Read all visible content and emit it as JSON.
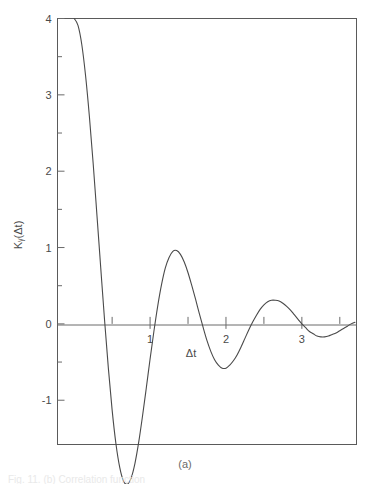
{
  "figure": {
    "panel_label": "(a)",
    "caption_partial": "Fig. 11. (b) Correlation function",
    "frame_color": "#5a5a5a",
    "curve_color": "#4a4a4a",
    "axis_color": "#6a6a6a"
  },
  "chart_data": {
    "type": "line",
    "title": "",
    "subtitle": "",
    "xlabel": "Δt",
    "ylabel": "Kᵧ(Δt)",
    "xlim": [
      -0.22,
      3.72
    ],
    "ylim": [
      -1.58,
      4.0
    ],
    "grid": false,
    "legend": null,
    "x_ticks_major": [
      1,
      2,
      3
    ],
    "x_ticks_major_labels": [
      "1",
      "2",
      "3"
    ],
    "x_ticks_minor": [
      0.5,
      1.5,
      2.5,
      3.5
    ],
    "y_ticks_major": [
      -1,
      0,
      1,
      2,
      3,
      4
    ],
    "y_ticks_major_labels": [
      "-1",
      "0",
      "1",
      "2",
      "3",
      "4"
    ],
    "y_ticks_minor": [
      -0.5,
      0.5,
      1.5,
      2.5,
      3.5
    ],
    "series": [
      {
        "name": "K_y(Δt)",
        "description": "damped oscillation 4*exp(-0.78*dt)*cos(3.45*dt)",
        "x": [
          0.0,
          0.05,
          0.1,
          0.15,
          0.2,
          0.25,
          0.3,
          0.35,
          0.4,
          0.45,
          0.5,
          0.55,
          0.6,
          0.65,
          0.7,
          0.75,
          0.8,
          0.85,
          0.9,
          0.95,
          1.0,
          1.05,
          1.1,
          1.15,
          1.2,
          1.25,
          1.3,
          1.35,
          1.4,
          1.45,
          1.5,
          1.55,
          1.6,
          1.65,
          1.7,
          1.75,
          1.8,
          1.85,
          1.9,
          1.95,
          2.0,
          2.05,
          2.1,
          2.15,
          2.2,
          2.25,
          2.3,
          2.35,
          2.4,
          2.45,
          2.5,
          2.55,
          2.6,
          2.65,
          2.7,
          2.75,
          2.8,
          2.85,
          2.9,
          2.95,
          3.0,
          3.05,
          3.1,
          3.15,
          3.2,
          3.25,
          3.3,
          3.35,
          3.4,
          3.45,
          3.5,
          3.55,
          3.6,
          3.65,
          3.7
        ],
        "y": [
          4.0,
          3.91,
          3.66,
          3.25,
          2.72,
          2.1,
          1.42,
          0.73,
          0.05,
          -0.58,
          -1.13,
          -1.57,
          -1.88,
          -2.06,
          -2.1,
          -2.02,
          -1.83,
          -1.55,
          -1.21,
          -0.84,
          -0.46,
          -0.1,
          0.23,
          0.51,
          0.73,
          0.87,
          0.95,
          0.96,
          0.91,
          0.81,
          0.67,
          0.5,
          0.32,
          0.13,
          -0.05,
          -0.22,
          -0.36,
          -0.47,
          -0.54,
          -0.58,
          -0.58,
          -0.54,
          -0.48,
          -0.4,
          -0.3,
          -0.19,
          -0.08,
          0.02,
          0.11,
          0.19,
          0.25,
          0.29,
          0.31,
          0.31,
          0.3,
          0.27,
          0.23,
          0.18,
          0.12,
          0.06,
          0.0,
          -0.05,
          -0.1,
          -0.13,
          -0.16,
          -0.17,
          -0.17,
          -0.16,
          -0.14,
          -0.12,
          -0.09,
          -0.06,
          -0.03,
          0.0,
          0.02
        ],
        "key_points": {
          "start": {
            "x": 0.0,
            "y": 4.0
          },
          "first_zero": {
            "x": 0.45,
            "y": 0.0
          },
          "global_min": {
            "x": 0.95,
            "y": -1.4
          },
          "second_zero": {
            "x": 1.7,
            "y": 0.0
          },
          "local_max": {
            "x": 2.1,
            "y": 0.47
          },
          "third_zero": {
            "x": 2.58,
            "y": 0.0
          },
          "second_min": {
            "x": 3.05,
            "y": -0.22
          },
          "fourth_zero": {
            "x": 3.55,
            "y": 0.0
          },
          "end": {
            "x": 3.72,
            "y": 0.05
          }
        }
      }
    ]
  }
}
